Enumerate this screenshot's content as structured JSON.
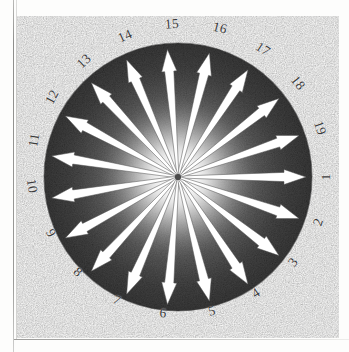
{
  "figure": {
    "name": "radial-arrow-diagram",
    "type": "polar-direction-diagram",
    "shape": "filled dark circle with white radial arrows emanating from a bright central glow",
    "center": {
      "x": 178,
      "y": 177
    },
    "radius": 134,
    "arrow_count": 19,
    "angle_step_deg": 18.947,
    "colors": {
      "disk_dark": "#4a4a4a",
      "disk_edge": "#3d3d3d",
      "center_glow": "#ffffff",
      "arrow": "#ffffff",
      "arrow_outline": "#5a5a5a",
      "label": "#3a3a3a",
      "page": "#fdfdfc",
      "rule": "#9a9a98"
    },
    "labels": [
      {
        "text": "1",
        "angle_deg": 0.0,
        "rotation_deg": 90,
        "x": 326,
        "y": 177
      },
      {
        "text": "2",
        "angle_deg": 18.9,
        "rotation_deg": 71.1,
        "x": 318,
        "y": 222
      },
      {
        "text": "3",
        "angle_deg": 37.9,
        "rotation_deg": 52.1,
        "x": 293,
        "y": 262
      },
      {
        "text": "4",
        "angle_deg": 56.8,
        "rotation_deg": 33.2,
        "x": 256,
        "y": 293
      },
      {
        "text": "5",
        "angle_deg": 75.8,
        "rotation_deg": 14.2,
        "x": 212,
        "y": 311
      },
      {
        "text": "6",
        "angle_deg": 94.7,
        "rotation_deg": -4.7,
        "x": 163,
        "y": 313
      },
      {
        "text": "7",
        "angle_deg": 113.7,
        "rotation_deg": -23.7,
        "x": 117,
        "y": 300
      },
      {
        "text": "8",
        "angle_deg": 132.6,
        "rotation_deg": -42.6,
        "x": 78,
        "y": 272
      },
      {
        "text": "9",
        "angle_deg": 151.6,
        "rotation_deg": -61.6,
        "x": 51,
        "y": 233
      },
      {
        "text": "10",
        "angle_deg": 170.5,
        "rotation_deg": -80.5,
        "x": 32,
        "y": 186
      },
      {
        "text": "11",
        "angle_deg": 189.5,
        "rotation_deg": 80.5,
        "x": 34,
        "y": 140
      },
      {
        "text": "12",
        "angle_deg": 208.4,
        "rotation_deg": 61.6,
        "x": 52,
        "y": 97
      },
      {
        "text": "13",
        "angle_deg": 227.4,
        "rotation_deg": 42.6,
        "x": 84,
        "y": 61
      },
      {
        "text": "14",
        "angle_deg": 246.3,
        "rotation_deg": 23.7,
        "x": 125,
        "y": 36
      },
      {
        "text": "15",
        "angle_deg": 265.3,
        "rotation_deg": 4.7,
        "x": 172,
        "y": 24
      },
      {
        "text": "16",
        "angle_deg": 284.2,
        "rotation_deg": -14.2,
        "x": 220,
        "y": 28
      },
      {
        "text": "17",
        "angle_deg": 303.2,
        "rotation_deg": -33.2,
        "x": 263,
        "y": 49
      },
      {
        "text": "18",
        "angle_deg": 322.1,
        "rotation_deg": -52.1,
        "x": 298,
        "y": 83
      },
      {
        "text": "19",
        "angle_deg": 341.1,
        "rotation_deg": -71.1,
        "x": 320,
        "y": 128
      }
    ]
  }
}
